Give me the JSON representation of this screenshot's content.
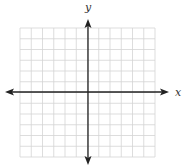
{
  "diagram": {
    "type": "coordinate-plane",
    "x_axis_label": "x",
    "y_axis_label": "y",
    "grid_columns": 12,
    "grid_rows": 12,
    "colors": {
      "grid": "#d4d4d4",
      "axis": "#222222",
      "label": "#333333"
    }
  }
}
